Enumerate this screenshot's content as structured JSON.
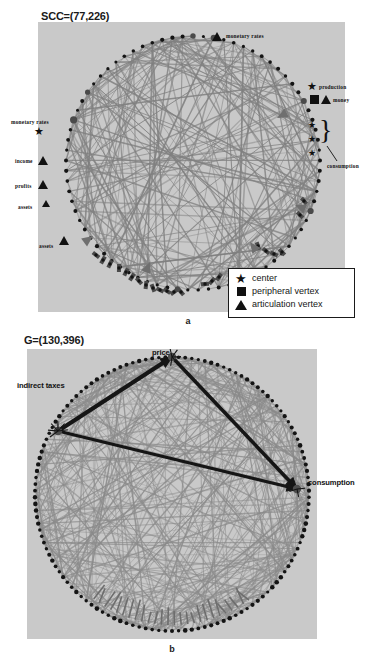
{
  "figure": {
    "type": "two-panel network diagram",
    "panels": [
      {
        "id": "a",
        "title": "SCC=(77,226)",
        "caption": "a",
        "graph": {
          "layout": "circular",
          "vertices": 77,
          "edges": 226,
          "node_color": "#555555",
          "edge_color": "#7d7d7d",
          "background": "#c9c9c9"
        },
        "annotations": [
          {
            "label": "monetary rates",
            "marker": "articulation vertex",
            "position": "top"
          },
          {
            "label": "production",
            "marker": "center",
            "position": "upper-right"
          },
          {
            "label": "money",
            "marker": "peripheral vertex, articulation vertex",
            "position": "right"
          },
          {
            "label": "consumption",
            "marker": "center x3 (braced)",
            "position": "right"
          },
          {
            "label": "monetary rates",
            "marker": "center",
            "position": "left"
          },
          {
            "label": "income",
            "marker": "articulation vertex",
            "position": "left"
          },
          {
            "label": "profits",
            "marker": "articulation vertex",
            "position": "left"
          },
          {
            "label": "assets",
            "marker": "articulation vertex",
            "position": "left"
          },
          {
            "label": "assets",
            "marker": "articulation vertex",
            "position": "lower-left"
          }
        ],
        "legend": {
          "items": [
            {
              "glyph": "star-icon",
              "label": "center"
            },
            {
              "glyph": "square-icon",
              "label": "peripheral vertex"
            },
            {
              "glyph": "triangle-icon",
              "label": "articulation vertex"
            }
          ]
        }
      },
      {
        "id": "b",
        "title": "G=(130,396)",
        "caption": "b",
        "graph": {
          "layout": "circular",
          "vertices": 130,
          "edges": 396,
          "node_color": "#222222",
          "edge_color": "#8a8a8a",
          "background": "#c9c9c9"
        },
        "annotations": [
          {
            "label": "price",
            "position": "top"
          },
          {
            "label": "indirect taxes",
            "position": "upper-left"
          },
          {
            "label": "consumption",
            "position": "right"
          }
        ]
      }
    ]
  },
  "chart_data": {
    "type": "scatter",
    "charts": [
      {
        "id": "a",
        "title": "SCC=(77,226)",
        "nodes": 77,
        "edges": 226,
        "highlighted": [
          {
            "name": "monetary rates",
            "role": "articulation vertex"
          },
          {
            "name": "production",
            "role": "center"
          },
          {
            "name": "money",
            "role": "peripheral vertex / articulation vertex"
          },
          {
            "name": "consumption",
            "role": "center"
          },
          {
            "name": "monetary rates",
            "role": "center"
          },
          {
            "name": "income",
            "role": "articulation vertex"
          },
          {
            "name": "profits",
            "role": "articulation vertex"
          },
          {
            "name": "assets",
            "role": "articulation vertex"
          },
          {
            "name": "assets",
            "role": "articulation vertex"
          }
        ]
      },
      {
        "id": "b",
        "title": "G=(130,396)",
        "nodes": 130,
        "edges": 396,
        "highlighted": [
          {
            "name": "price",
            "role": "hub"
          },
          {
            "name": "indirect taxes",
            "role": "hub"
          },
          {
            "name": "consumption",
            "role": "hub"
          }
        ]
      }
    ],
    "xlabel": "",
    "ylabel": "",
    "legend": [
      "center",
      "peripheral vertex",
      "articulation vertex"
    ],
    "grid": false
  }
}
